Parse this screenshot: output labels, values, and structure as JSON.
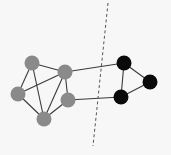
{
  "diagram": {
    "background": "#f7f7f7",
    "edge_color": "#3a3a3a",
    "cut_line": {
      "x1": 108,
      "y1": 3,
      "x2": 93,
      "y2": 146,
      "color": "#555555",
      "dash": "3,2.5"
    },
    "clusters": [
      {
        "name": "gray-cluster",
        "color": "#8a8a8a"
      },
      {
        "name": "black-cluster",
        "color": "#0a0a0a"
      }
    ],
    "nodes": [
      {
        "id": "A",
        "x": 32,
        "y": 63,
        "r": 7.5,
        "cluster": 0
      },
      {
        "id": "B",
        "x": 65,
        "y": 72,
        "r": 7.5,
        "cluster": 0
      },
      {
        "id": "C",
        "x": 18,
        "y": 94,
        "r": 7.5,
        "cluster": 0
      },
      {
        "id": "D",
        "x": 68,
        "y": 100,
        "r": 7.5,
        "cluster": 0
      },
      {
        "id": "E",
        "x": 44,
        "y": 119,
        "r": 7.5,
        "cluster": 0
      },
      {
        "id": "F",
        "x": 124,
        "y": 63,
        "r": 7.5,
        "cluster": 1
      },
      {
        "id": "G",
        "x": 150,
        "y": 82,
        "r": 7.5,
        "cluster": 1
      },
      {
        "id": "H",
        "x": 121,
        "y": 97,
        "r": 7.5,
        "cluster": 1
      }
    ],
    "edges": [
      [
        "A",
        "B"
      ],
      [
        "A",
        "C"
      ],
      [
        "A",
        "E"
      ],
      [
        "B",
        "C"
      ],
      [
        "B",
        "D"
      ],
      [
        "B",
        "E"
      ],
      [
        "C",
        "E"
      ],
      [
        "D",
        "E"
      ],
      [
        "B",
        "F"
      ],
      [
        "D",
        "H"
      ],
      [
        "F",
        "G"
      ],
      [
        "F",
        "H"
      ],
      [
        "G",
        "H"
      ]
    ]
  }
}
